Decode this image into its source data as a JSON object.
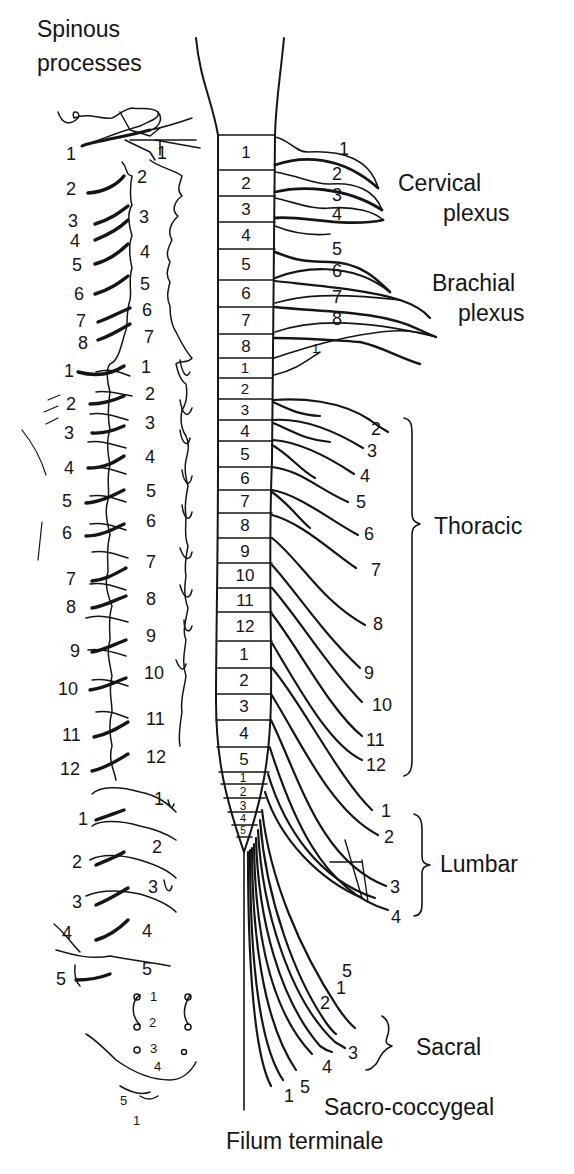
{
  "title_labels": {
    "spinous_processes": [
      "Spinous",
      "processes"
    ],
    "filum_terminale": "Filum terminale"
  },
  "plexus_labels": {
    "cervical": [
      "Cervical",
      "plexus"
    ],
    "brachial": [
      "Brachial",
      "plexus"
    ],
    "thoracic": "Thoracic",
    "lumbar": "Lumbar",
    "sacral": "Sacral",
    "sacro_coccygeal": "Sacro-coccygeal"
  },
  "spinal_cord_segments": {
    "cervical": [
      "1",
      "2",
      "3",
      "4",
      "5",
      "6",
      "7",
      "8"
    ],
    "thoracic": [
      "1",
      "2",
      "3",
      "4",
      "5",
      "6",
      "7",
      "8",
      "9",
      "10",
      "11",
      "12"
    ],
    "lumbar": [
      "1",
      "2",
      "3",
      "4",
      "5"
    ],
    "sacral": [
      "1",
      "2",
      "3",
      "4",
      "5"
    ]
  },
  "nerve_root_labels": {
    "cervical": [
      "1",
      "2",
      "3",
      "4",
      "5",
      "6",
      "7",
      "8"
    ],
    "thoracic_first": "1",
    "thoracic": [
      "2",
      "3",
      "4",
      "5",
      "6",
      "7",
      "8",
      "9",
      "10",
      "11",
      "12"
    ],
    "lumbar": [
      "1",
      "2",
      "3",
      "4"
    ],
    "sacral": [
      "5",
      "1",
      "2",
      "3",
      "4"
    ],
    "sacro_coccygeal": [
      "1",
      "5"
    ]
  },
  "vertebral_column": {
    "root_labels_cervical": [
      "1",
      "2",
      "3",
      "4",
      "5",
      "6",
      "7",
      "8"
    ],
    "root_labels_thoracic": [
      "1",
      "2",
      "3",
      "4",
      "5",
      "6",
      "7",
      "8",
      "9",
      "10",
      "11",
      "12"
    ],
    "root_labels_lumbar": [
      "1",
      "2",
      "3",
      "4",
      "5"
    ],
    "vertebra_labels_cervical": [
      "1",
      "2",
      "3",
      "4",
      "5",
      "6",
      "7"
    ],
    "vertebra_labels_thoracic": [
      "1",
      "2",
      "3",
      "4",
      "5",
      "6",
      "7",
      "8",
      "9",
      "10",
      "11",
      "12"
    ],
    "vertebra_labels_lumbar": [
      "1",
      "2",
      "3",
      "4",
      "5"
    ],
    "sacral_labels": [
      "1",
      "2",
      "3",
      "4",
      "5"
    ],
    "coccyx_label": "1"
  }
}
